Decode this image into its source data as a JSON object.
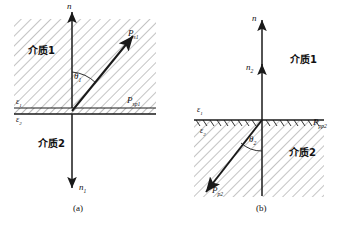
{
  "figure": {
    "title_caption_a": "(a)",
    "title_caption_b": "(b)",
    "colors": {
      "line": "#1a1a1a",
      "hatch": "#7a7a7a",
      "background": "#ffffff"
    }
  },
  "panel_a": {
    "caption": "(a)",
    "medium_upper_label": "介质1",
    "medium_lower_label": "介质2",
    "normal_up_label": "n",
    "normal_down_label": "n",
    "normal_down_sub": "1",
    "permittivity_upper": "ε",
    "permittivity_upper_sub": "1",
    "permittivity_lower": "ε",
    "permittivity_lower_sub": "2",
    "angle_label": "θ",
    "angle_sub": "1",
    "vector_label": "P",
    "vector_sub": "s1",
    "surface_vector_label": "P",
    "surface_vector_sub": "sp1"
  },
  "panel_b": {
    "caption": "(b)",
    "medium_upper_label": "介质1",
    "medium_lower_label": "介质2",
    "normal_up_label": "n",
    "normal_mid_label": "n",
    "normal_mid_sub": "2",
    "permittivity_upper": "ε",
    "permittivity_upper_sub": "1",
    "permittivity_lower": "ε",
    "permittivity_lower_sub": "2",
    "angle_label": "θ",
    "angle_sub": "2",
    "vector_label": "P",
    "vector_sub": "p2",
    "surface_vector_label": "P",
    "surface_vector_sub": "pp2"
  }
}
